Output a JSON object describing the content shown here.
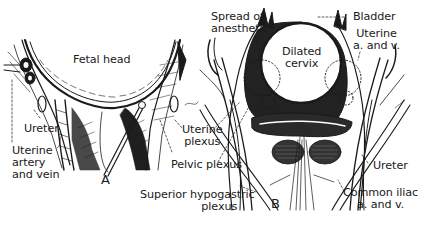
{
  "figure": {
    "panels": [
      {
        "id": "A",
        "letter": "A",
        "labels": {
          "fetal_head": "Fetal head",
          "ureter": "Ureter",
          "uterine_artery_vein_1": "Uterine",
          "uterine_artery_vein_2": "artery",
          "uterine_artery_vein_3": "and vein",
          "uterine_plexus_1": "Uterine",
          "uterine_plexus_2": "plexus",
          "pelvic_plexus": "Pelvic plexus",
          "superior_hypogastric_1": "Superior hypogastric",
          "superior_hypogastric_2": "plexus"
        }
      },
      {
        "id": "B",
        "letter": "B",
        "labels": {
          "spread_1": "Spread of",
          "spread_2": "anesthetic",
          "bladder": "Bladder",
          "uterine_av_1": "Uterine",
          "uterine_av_2": "a. and v.",
          "dilated_cervix_1": "Dilated",
          "dilated_cervix_2": "cervix",
          "ureter": "Ureter",
          "common_iliac_1": "Common iliac",
          "common_iliac_2": "a. and v."
        }
      }
    ],
    "colors": {
      "ink": "#1a1a1a",
      "background": "#ffffff"
    }
  }
}
